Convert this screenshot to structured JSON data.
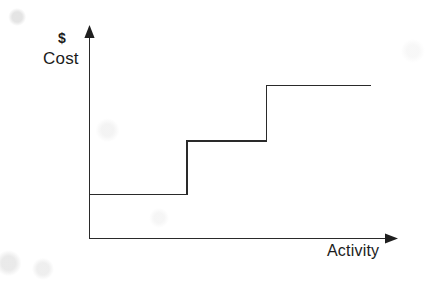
{
  "figure": {
    "kind": "step-cost-graph",
    "background_color": "#fdfdfc",
    "ink_color": "#2a2a2a"
  },
  "labels": {
    "y_axis_unit": "$",
    "y_axis_title": "Cost",
    "x_axis_title": "Activity"
  },
  "chart_data": {
    "type": "line",
    "subtype": "step",
    "title": "",
    "subtitle": "",
    "xlabel": "Activity",
    "ylabel": "Cost",
    "y_unit": "$",
    "grid": false,
    "legend": null,
    "axis_style": "arrow-headed open axes, no tick marks, no tick labels",
    "xlim": [
      0,
      10
    ],
    "ylim": [
      0,
      10
    ],
    "x_tick_labels": [],
    "y_tick_labels": [],
    "series": [
      {
        "name": "Step cost",
        "interpolation": "step-after",
        "color": "#2a2a2a",
        "steps": [
          {
            "index": 1,
            "x_start": 0.0,
            "x_end": 3.2,
            "y": 2.2
          },
          {
            "index": 2,
            "x_start": 3.2,
            "x_end": 5.8,
            "y": 4.9
          },
          {
            "index": 3,
            "x_start": 5.8,
            "x_end": 9.2,
            "y": 7.7
          }
        ],
        "x": [
          0.0,
          3.2,
          3.2,
          5.8,
          5.8,
          9.2
        ],
        "values": [
          2.2,
          2.2,
          4.9,
          4.9,
          7.7,
          7.7
        ]
      }
    ],
    "annotations": []
  }
}
